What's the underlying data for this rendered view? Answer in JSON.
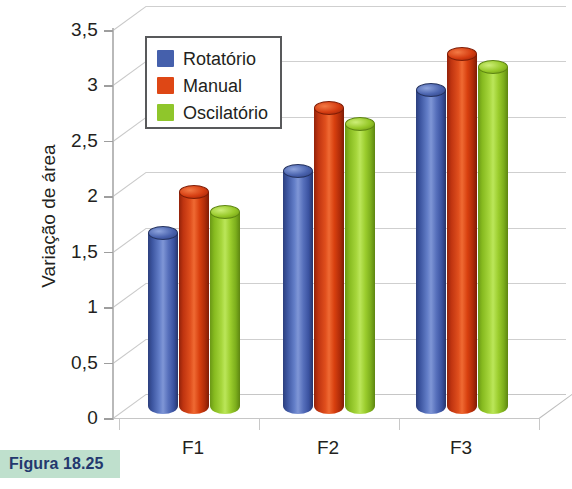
{
  "figure": {
    "caption": "Figura 18.25"
  },
  "chart_data": {
    "type": "bar",
    "title": "",
    "xlabel": "",
    "ylabel": "Variação de área",
    "categories": [
      "F1",
      "F2",
      "F3"
    ],
    "ylim": [
      0,
      3.5
    ],
    "yticks": [
      "0",
      "0,5",
      "1",
      "1,5",
      "2",
      "2,5",
      "3",
      "3,5"
    ],
    "ytick_values": [
      0,
      0.5,
      1,
      1.5,
      2,
      2.5,
      3,
      3.5
    ],
    "grid": true,
    "legend_position": "top-left-inside",
    "style": "3d-cylinder",
    "series": [
      {
        "name": "Rotatório",
        "color": "#4560ac",
        "values": [
          1.67,
          2.23,
          2.96
        ]
      },
      {
        "name": "Manual",
        "color": "#de4715",
        "values": [
          2.04,
          2.8,
          3.28
        ]
      },
      {
        "name": "Oscilatório",
        "color": "#8fc62b",
        "values": [
          1.86,
          2.65,
          3.17
        ]
      }
    ]
  },
  "colors": {
    "blue": "#4560ac",
    "red": "#de4715",
    "green": "#8fc62b",
    "caption_bg": "#bfe0cd",
    "caption_fg": "#24386e",
    "axis": "#b9b9b9",
    "text": "#231f20"
  }
}
